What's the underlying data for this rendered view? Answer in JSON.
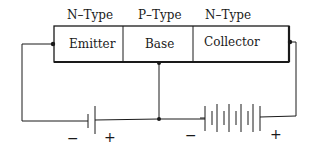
{
  "diagram": {
    "type_labels": [
      "N–Type",
      "P–Type",
      "N–Type"
    ],
    "regions": [
      "Emitter",
      "Base",
      "Collector"
    ],
    "emitter_battery": {
      "cells": 1,
      "negative_label": "−",
      "positive_label": "+"
    },
    "collector_battery": {
      "cells": 5,
      "negative_label": "−",
      "positive_label": "+"
    },
    "colors": {
      "line": "#1a1a1a",
      "background": "#ffffff"
    }
  }
}
